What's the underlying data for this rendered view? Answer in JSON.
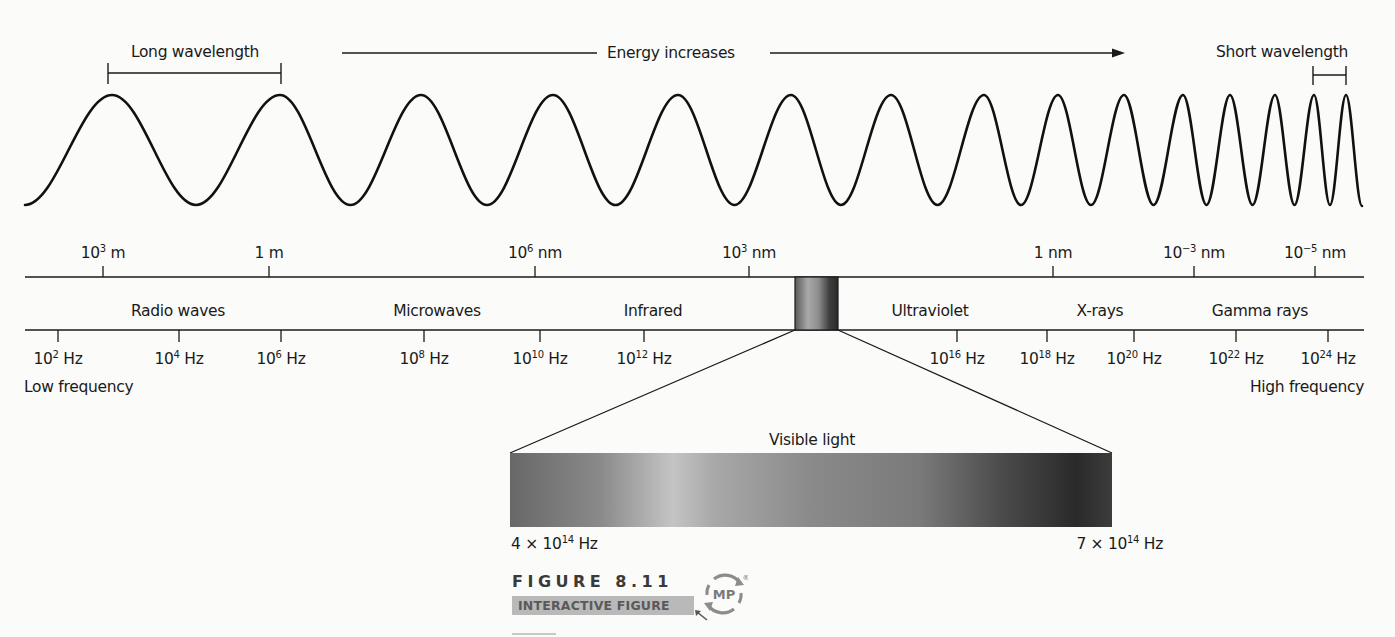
{
  "header": {
    "long_wavelength_label": "Long wavelength",
    "energy_label": "Energy increases",
    "short_wavelength_label": "Short wavelength"
  },
  "wave": {
    "peaks_x": [
      112,
      280,
      421,
      553,
      678,
      791,
      891,
      984,
      1058,
      1124,
      1183,
      1230,
      1275,
      1314,
      1346
    ],
    "peak_y": 95,
    "trough_y": 205,
    "start_x": 25,
    "end_x": 1362
  },
  "wavelength_scale": {
    "ticks": [
      {
        "base": "10",
        "exp": "3",
        "unit": " m",
        "x": 103
      },
      {
        "base": "1",
        "exp": "",
        "unit": " m",
        "x": 269
      },
      {
        "base": "10",
        "exp": "6",
        "unit": " nm",
        "x": 535
      },
      {
        "base": "10",
        "exp": "3",
        "unit": " nm",
        "x": 749
      },
      {
        "base": "1",
        "exp": "",
        "unit": " nm",
        "x": 1053
      },
      {
        "base": "10",
        "exp": "−3",
        "unit": " nm",
        "x": 1194
      },
      {
        "base": "10",
        "exp": "−5",
        "unit": " nm",
        "x": 1315
      }
    ]
  },
  "regions": [
    {
      "label": "Radio waves",
      "x": 178
    },
    {
      "label": "Microwaves",
      "x": 437
    },
    {
      "label": "Infrared",
      "x": 653
    },
    {
      "label": "Ultraviolet",
      "x": 930
    },
    {
      "label": "X-rays",
      "x": 1100
    },
    {
      "label": "Gamma rays",
      "x": 1260
    }
  ],
  "frequency_scale": {
    "ticks": [
      {
        "base": "10",
        "exp": "2",
        "unit": " Hz",
        "x": 58
      },
      {
        "base": "10",
        "exp": "4",
        "unit": " Hz",
        "x": 179
      },
      {
        "base": "10",
        "exp": "6",
        "unit": " Hz",
        "x": 281
      },
      {
        "base": "10",
        "exp": "8",
        "unit": " Hz",
        "x": 424
      },
      {
        "base": "10",
        "exp": "10",
        "unit": " Hz",
        "x": 540
      },
      {
        "base": "10",
        "exp": "12",
        "unit": " Hz",
        "x": 644
      },
      {
        "base": "10",
        "exp": "16",
        "unit": " Hz",
        "x": 957
      },
      {
        "base": "10",
        "exp": "18",
        "unit": " Hz",
        "x": 1047
      },
      {
        "base": "10",
        "exp": "20",
        "unit": " Hz",
        "x": 1134
      },
      {
        "base": "10",
        "exp": "22",
        "unit": " Hz",
        "x": 1236
      },
      {
        "base": "10",
        "exp": "24",
        "unit": " Hz",
        "x": 1328
      }
    ],
    "low_label": "Low frequency",
    "high_label": "High frequency"
  },
  "visible_light": {
    "label": "Visible light",
    "left_freq": {
      "prefix": "4 × ",
      "base": "10",
      "exp": "14",
      "unit": " Hz"
    },
    "right_freq": {
      "prefix": "7 × ",
      "base": "10",
      "exp": "14",
      "unit": " Hz"
    },
    "gradient_stops": [
      {
        "offset": "0%",
        "color": "#686868"
      },
      {
        "offset": "15%",
        "color": "#8a8a8a"
      },
      {
        "offset": "27%",
        "color": "#c4c4c4"
      },
      {
        "offset": "34%",
        "color": "#a8a8a8"
      },
      {
        "offset": "50%",
        "color": "#8a8a8a"
      },
      {
        "offset": "68%",
        "color": "#7a7a7a"
      },
      {
        "offset": "82%",
        "color": "#4a4a4a"
      },
      {
        "offset": "94%",
        "color": "#2a2a2a"
      },
      {
        "offset": "100%",
        "color": "#3c3c3c"
      }
    ]
  },
  "caption": {
    "figure_label": "FIGURE 8.11",
    "interactive_label": "INTERACTIVE FIGURE",
    "badge_text": "MP",
    "badge_mark": "®"
  }
}
